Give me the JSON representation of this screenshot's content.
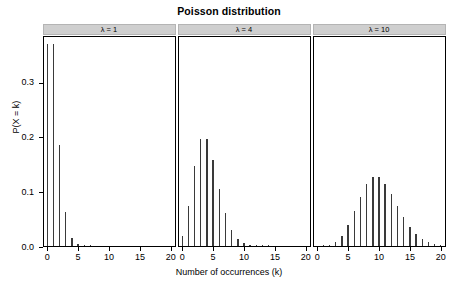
{
  "title": "Poisson distribution",
  "axes": {
    "ylabel": "P(X = k)",
    "xlabel": "Number of occurrences (k)",
    "yticks": [
      "0.0",
      "0.1",
      "0.2",
      "0.3"
    ],
    "ytick_values": [
      0.0,
      0.1,
      0.2,
      0.3
    ],
    "xticks": [
      "0",
      "5",
      "10",
      "15",
      "20"
    ],
    "xtick_values": [
      0,
      5,
      10,
      15,
      20
    ]
  },
  "panels": [
    {
      "label": "λ = 1",
      "lambda": 1
    },
    {
      "label": "λ = 4",
      "lambda": 4
    },
    {
      "label": "λ = 10",
      "lambda": 10
    }
  ],
  "colors": {
    "bar": "#3a3a3a",
    "strip_fill": "#cfcfcf",
    "strip_border": "#b4b4b4",
    "axis": "#000000",
    "background": "#ffffff"
  },
  "chart_data": {
    "type": "bar",
    "title": "Poisson distribution",
    "xlabel": "Number of occurrences (k)",
    "ylabel": "P(X = k)",
    "xlim": [
      -0.6,
      20.6
    ],
    "ylim": [
      0,
      0.385
    ],
    "grid": false,
    "legend": "none",
    "facet_layout": "1 row x 3 columns",
    "facets": [
      {
        "name": "λ = 1",
        "lambda": 1,
        "x": [
          0,
          1,
          2,
          3,
          4,
          5,
          6,
          7,
          8,
          9,
          10,
          11,
          12,
          13,
          14,
          15,
          16,
          17,
          18,
          19,
          20
        ],
        "values": [
          0.3679,
          0.3679,
          0.1839,
          0.0613,
          0.0153,
          0.0031,
          0.0005,
          0.0001,
          0.0,
          0.0,
          0.0,
          0.0,
          0.0,
          0.0,
          0.0,
          0.0,
          0.0,
          0.0,
          0.0,
          0.0,
          0.0
        ]
      },
      {
        "name": "λ = 4",
        "lambda": 4,
        "x": [
          0,
          1,
          2,
          3,
          4,
          5,
          6,
          7,
          8,
          9,
          10,
          11,
          12,
          13,
          14,
          15,
          16,
          17,
          18,
          19,
          20
        ],
        "values": [
          0.0183,
          0.0733,
          0.1465,
          0.1954,
          0.1954,
          0.1563,
          0.1042,
          0.0595,
          0.0298,
          0.0132,
          0.0053,
          0.0019,
          0.0006,
          0.0002,
          0.0001,
          0.0,
          0.0,
          0.0,
          0.0,
          0.0,
          0.0
        ]
      },
      {
        "name": "λ = 10",
        "lambda": 10,
        "x": [
          0,
          1,
          2,
          3,
          4,
          5,
          6,
          7,
          8,
          9,
          10,
          11,
          12,
          13,
          14,
          15,
          16,
          17,
          18,
          19,
          20
        ],
        "values": [
          0.0,
          0.0005,
          0.0023,
          0.0076,
          0.0189,
          0.0378,
          0.0631,
          0.0901,
          0.1126,
          0.1251,
          0.1251,
          0.1137,
          0.0948,
          0.0729,
          0.0521,
          0.0347,
          0.0217,
          0.0128,
          0.0071,
          0.0037,
          0.0019
        ]
      }
    ]
  }
}
